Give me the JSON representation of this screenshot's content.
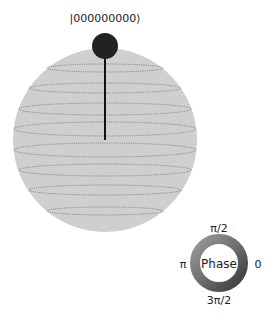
{
  "figure": {
    "type": "qsphere",
    "state_label": "|000000000⟩",
    "sphere_color": "#cfcfcf",
    "latitude_line_color": "#888888",
    "state_point_color": "#222222",
    "state_vector_color": "#111111"
  },
  "phase_legend": {
    "center_label": "Phase",
    "labels": {
      "top": "π/2",
      "left": "π",
      "right": "0",
      "bottom": "3π/2"
    }
  }
}
